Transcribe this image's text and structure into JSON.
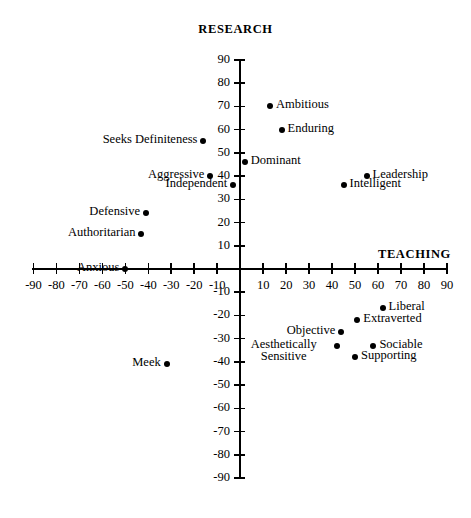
{
  "chart_data": {
    "type": "scatter",
    "title": "",
    "xlabel": "TEACHING",
    "ylabel": "RESEARCH",
    "xlim": [
      -90,
      90
    ],
    "ylim": [
      -90,
      90
    ],
    "grid": false,
    "legend": "none",
    "xticks": [
      -90,
      -80,
      -70,
      -60,
      -50,
      -40,
      -30,
      -20,
      -10,
      10,
      20,
      30,
      40,
      50,
      60,
      70,
      80,
      90
    ],
    "yticks": [
      90,
      80,
      70,
      60,
      50,
      40,
      30,
      20,
      10,
      -10,
      -20,
      -30,
      -40,
      -50,
      -60,
      -70,
      -80,
      -90
    ],
    "xtick_labels": [
      "-90",
      "-80",
      "-70",
      "-60",
      "-50",
      "-40",
      "-30",
      "-20",
      "-10",
      "10",
      "20",
      "30",
      "40",
      "50",
      "60",
      "70",
      "80",
      "90"
    ],
    "ytick_labels": [
      "90",
      "80",
      "70",
      "60",
      "50",
      "40",
      "30",
      "20",
      "10",
      "-10",
      "-20",
      "-30",
      "-40",
      "-50",
      "-60",
      "-70",
      "-80",
      "-90"
    ],
    "points": [
      {
        "label": "Ambitious",
        "x": 13,
        "y": 70,
        "label_side": "right"
      },
      {
        "label": "Enduring",
        "x": 18,
        "y": 60,
        "label_side": "right"
      },
      {
        "label": "Seeks Definiteness",
        "x": -16,
        "y": 55,
        "label_side": "left"
      },
      {
        "label": "Dominant",
        "x": 2,
        "y": 46,
        "label_side": "right"
      },
      {
        "label": "Aggressive",
        "x": -13,
        "y": 40,
        "label_side": "left"
      },
      {
        "label": "Independent",
        "x": -3,
        "y": 36,
        "label_side": "left"
      },
      {
        "label": "Leadership",
        "x": 55,
        "y": 40,
        "label_side": "right"
      },
      {
        "label": "Intelligent",
        "x": 45,
        "y": 36,
        "label_side": "right"
      },
      {
        "label": "Defensive",
        "x": -41,
        "y": 24,
        "label_side": "left"
      },
      {
        "label": "Authoritarian",
        "x": -43,
        "y": 15,
        "label_side": "left"
      },
      {
        "label": "Anxious",
        "x": -50,
        "y": 0,
        "label_side": "left"
      },
      {
        "label": "Liberal",
        "x": 62,
        "y": -17,
        "label_side": "right"
      },
      {
        "label": "Extraverted",
        "x": 51,
        "y": -22,
        "label_side": "right"
      },
      {
        "label": "Objective",
        "x": 44,
        "y": -27,
        "label_side": "left"
      },
      {
        "label": "Aesthetically Sensitive",
        "x": 42,
        "y": -33,
        "label_side": "left"
      },
      {
        "label": "Sociable",
        "x": 58,
        "y": -33,
        "label_side": "right"
      },
      {
        "label": "Supporting",
        "x": 50,
        "y": -38,
        "label_side": "right"
      },
      {
        "label": "Meek",
        "x": -32,
        "y": -41,
        "label_side": "left"
      }
    ]
  },
  "axes": {
    "vertical_title": "RESEARCH",
    "horizontal_title": "TEACHING"
  }
}
